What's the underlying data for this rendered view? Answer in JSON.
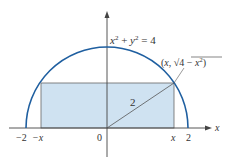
{
  "diagram": {
    "equation_label": {
      "base_x": "x",
      "sup1": "2",
      "plus": " + ",
      "base_y": "y",
      "sup2": "2",
      "eq": " = 4"
    },
    "point_label": {
      "open": "(",
      "x": "x",
      "comma": ", ",
      "radical": "√",
      "inner": "4 − ",
      "inner_x": "x",
      "sup": "2",
      "close": ")"
    },
    "radius_label": "2",
    "x_axis_label": "x",
    "ticks": {
      "neg_two": "−2",
      "neg_x": "−x",
      "zero": "0",
      "pos_x": "x",
      "pos_two": "2"
    },
    "colors": {
      "curve": "#1f5fa0",
      "fill": "#cfe2f1",
      "lines": "#555555",
      "axis": "#444444"
    }
  }
}
